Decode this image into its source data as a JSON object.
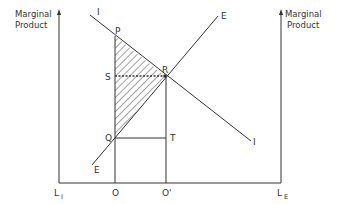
{
  "diagram": {
    "type": "marginal-product-allocation",
    "left_axis": {
      "title_line1": "Marginal",
      "title_line2": "Product",
      "origin_label": "L",
      "origin_sub": "I"
    },
    "right_axis": {
      "title_line1": "Marginal",
      "title_line2": "Product",
      "origin_label": "L",
      "origin_sub": "E"
    },
    "curves": [
      {
        "name": "I",
        "label_start": "I",
        "label_end": "I",
        "slope": "downward"
      },
      {
        "name": "E",
        "label_start": "E",
        "label_end": "E",
        "slope": "upward"
      }
    ],
    "points": {
      "P": "P",
      "S": "S",
      "R": "R",
      "Q": "Q",
      "T": "T"
    },
    "x_labels": {
      "O": "O",
      "O_prime": "O'"
    },
    "shaded_region": "PRQ triangle (hatched)",
    "colors": {
      "line": "#333333",
      "background": "#ffffff"
    }
  }
}
